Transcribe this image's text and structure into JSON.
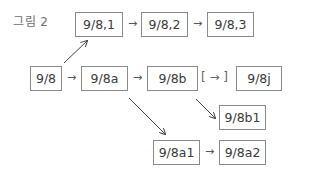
{
  "figure": {
    "label": "그림 2"
  },
  "nodes": {
    "n98": "9/8",
    "n98_1": "9/8,1",
    "n98_2": "9/8,2",
    "n98_3": "9/8,3",
    "n98a": "9/8a",
    "n98b": "9/8b",
    "n98j": "9/8j",
    "n98b1": "9/8b1",
    "n98a1": "9/8a1",
    "n98a2": "9/8a2"
  },
  "arrows": {
    "right": "→",
    "bracketed": "[ → ]"
  },
  "edges": [
    {
      "from": "9/8",
      "to": "9/8,1",
      "style": "diagonal"
    },
    {
      "from": "9/8,1",
      "to": "9/8,2",
      "style": "inline"
    },
    {
      "from": "9/8,2",
      "to": "9/8,3",
      "style": "inline"
    },
    {
      "from": "9/8",
      "to": "9/8a",
      "style": "inline"
    },
    {
      "from": "9/8a",
      "to": "9/8b",
      "style": "inline"
    },
    {
      "from": "9/8b",
      "to": "9/8j",
      "style": "bracketed"
    },
    {
      "from": "9/8b",
      "to": "9/8b1",
      "style": "diagonal"
    },
    {
      "from": "9/8a",
      "to": "9/8a1",
      "style": "diagonal"
    },
    {
      "from": "9/8a1",
      "to": "9/8a2",
      "style": "inline"
    }
  ]
}
